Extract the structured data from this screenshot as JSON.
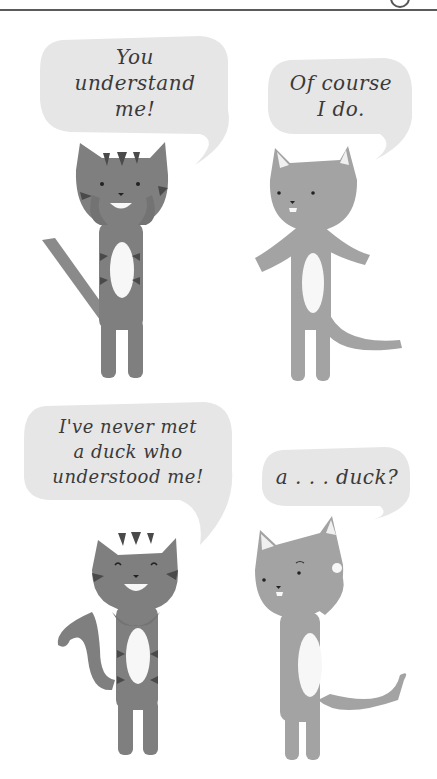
{
  "comic": {
    "panels": [
      {
        "id": 1,
        "speaker": "tabby-cat",
        "speech": "You\nunderstand\nme!"
      },
      {
        "id": 2,
        "speaker": "gray-cat",
        "speech": "Of course\nI do."
      },
      {
        "id": 3,
        "speaker": "tabby-cat",
        "speech": "I've never met\na duck who\nunderstood me!"
      },
      {
        "id": 4,
        "speaker": "gray-cat",
        "speech": "a . . . duck?"
      }
    ]
  },
  "colors": {
    "bubble": "#e6e6e6",
    "tabby_body": "#7f7f7f",
    "tabby_stripes": "#4a4a4a",
    "gray_body": "#a3a3a3",
    "belly": "#f7f7f7",
    "text": "#3a3a3a",
    "rule": "#5a5a5a"
  }
}
